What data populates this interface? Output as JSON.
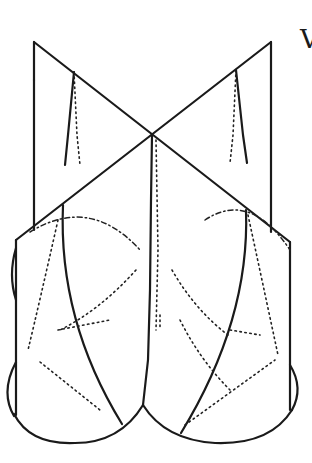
{
  "figure": {
    "corner_label": "V",
    "stroke_color": "#1a1a1a",
    "background": "#ffffff"
  }
}
